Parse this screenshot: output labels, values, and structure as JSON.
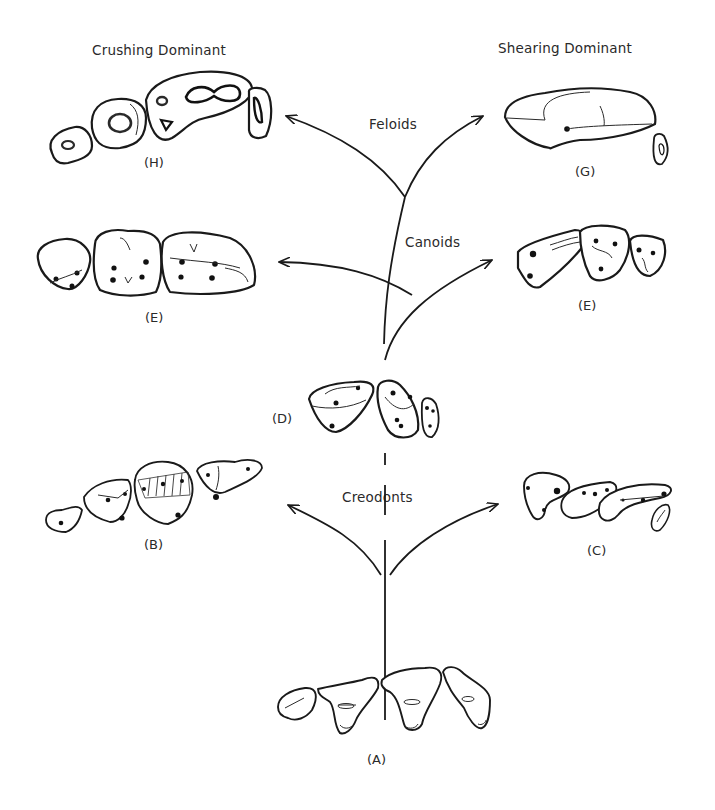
{
  "headers": {
    "left": "Crushing Dominant",
    "right": "Shearing Dominant"
  },
  "groups": {
    "feloids": "Feloids",
    "canoids": "Canoids",
    "creodonts": "Creodonts"
  },
  "specimens": [
    {
      "id": "A",
      "label": "(A)",
      "position": "bottom-center",
      "role": "ancestral tribosphenic dentition"
    },
    {
      "id": "B",
      "label": "(B)",
      "position": "lower-left",
      "lineage": "Creodonts",
      "trend": "crushing"
    },
    {
      "id": "C",
      "label": "(C)",
      "position": "lower-right",
      "lineage": "Creodonts",
      "trend": "shearing"
    },
    {
      "id": "D",
      "label": "(D)",
      "position": "center",
      "role": "carnivoran ancestor"
    },
    {
      "id": "E",
      "label": "(E)",
      "position": "middle-right",
      "lineage": "Canoids",
      "trend": "shearing"
    },
    {
      "id": "F",
      "label": "(F)",
      "position": "middle-left",
      "lineage": "Canoids",
      "trend": "crushing"
    },
    {
      "id": "G",
      "label": "(G)",
      "position": "top-right",
      "lineage": "Feloids",
      "trend": "shearing"
    },
    {
      "id": "H",
      "label": "(H)",
      "position": "top-left",
      "lineage": "Feloids",
      "trend": "crushing"
    }
  ]
}
